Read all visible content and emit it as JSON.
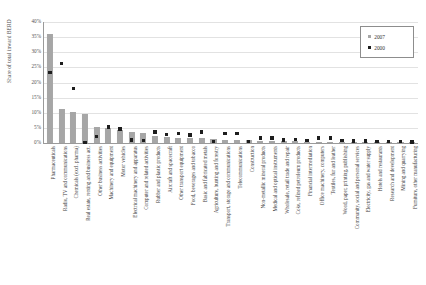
{
  "chart_data": {
    "type": "bar",
    "title": "",
    "xlabel": "",
    "ylabel": "Share of total inward BERD",
    "ylim": [
      0,
      40
    ],
    "ytick_labels": [
      "40%",
      "35%",
      "30%",
      "25%",
      "20%",
      "15%",
      "10%",
      "5%",
      "0%"
    ],
    "ytick_values": [
      40,
      35,
      30,
      25,
      20,
      15,
      10,
      5,
      0
    ],
    "grid": true,
    "legend_position": "top-right",
    "categories": [
      "Pharmaceuticals",
      "Radio, TV and communications",
      "Chemicals (excl. pharma)",
      "Real estate, renting and business act.",
      "Other business activities",
      "Machinery and equipment",
      "Motor vehicles",
      "Electrical machinery and apparatus",
      "Computer and related activities",
      "Rubber and plastic products",
      "Aircraft and spacecraft",
      "Other transport equipment",
      "Food, beverages and tobacco",
      "Basic and fabricated metals",
      "Agriculture, hunting and forestry",
      "Transport, storage and communications",
      "Telecommunications",
      "Construction",
      "Non-metallic mineral products",
      "Medical and optical instruments",
      "Wholesale, retail trade and repair",
      "Coke, refined petroleum products",
      "Financial intermediation",
      "Office machinery, computers",
      "Textiles, fur and leather",
      "Wood, paper, printing, publishing",
      "Community, social and personal services",
      "Electricity, gas and water supply",
      "Hotels and restaurants",
      "Research and development",
      "Mining and quarrying",
      "Furniture, other manufacturing"
    ],
    "series": [
      {
        "name": "2007",
        "color": "#a6a6a6",
        "marker": "bar",
        "values": [
          36.2,
          11.1,
          10.2,
          9.6,
          5.2,
          4.9,
          4.4,
          3.8,
          3.3,
          2.3,
          2.0,
          1.8,
          1.6,
          1.5,
          1.3,
          1.1,
          1.0,
          0.9,
          0.8,
          0.7,
          0.7,
          0.6,
          0.5,
          0.5,
          0.4,
          0.4,
          0.3,
          0.3,
          0.2,
          0.2,
          0.2,
          0.1
        ]
      },
      {
        "name": "2000",
        "color": "#1d1d1d",
        "marker": "square",
        "values": [
          23.4,
          26.3,
          18.1,
          0.2,
          2.1,
          5.3,
          4.6,
          1.0,
          0.9,
          3.6,
          2.8,
          3.2,
          2.6,
          3.6,
          0.4,
          3.2,
          3.1,
          0.4,
          1.7,
          1.6,
          1.0,
          1.1,
          0.9,
          1.6,
          1.6,
          0.8,
          0.7,
          0.7,
          0.5,
          0.5,
          0.4,
          0.3
        ]
      }
    ]
  },
  "legend": {
    "items": [
      {
        "label": "2007",
        "color": "#a6a6a6"
      },
      {
        "label": "2000",
        "color": "#1d1d1d"
      }
    ]
  }
}
